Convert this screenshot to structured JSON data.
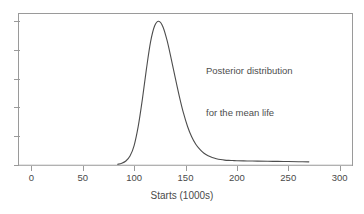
{
  "chart_data": {
    "type": "line",
    "title": "",
    "subtitle": "",
    "xlabel": "Starts (1000s)",
    "ylabel": "",
    "xlim": [
      -12,
      312
    ],
    "ylim": [
      0,
      1.05
    ],
    "grid": false,
    "legend_position": "none",
    "xticks": [
      0,
      50,
      100,
      150,
      200,
      250,
      300
    ],
    "xticklabels": [
      "0",
      "50",
      "100",
      "150",
      "200",
      "250",
      "300"
    ],
    "yticks": [
      0,
      0.2,
      0.4,
      0.6,
      0.8,
      1.0
    ],
    "yticklabels": [
      "",
      "",
      "",
      "",
      "",
      ""
    ],
    "annotations": [
      {
        "lines": [
          "Posterior distribution",
          "for the mean life"
        ],
        "x": 175,
        "y": 0.85
      }
    ],
    "series": [
      {
        "name": "Posterior density of mean life",
        "color": "#4d4d4d",
        "linewidth": 1.1,
        "x": [
          84,
          88,
          92,
          96,
          100,
          104,
          108,
          112,
          116,
          120,
          124,
          128,
          132,
          136,
          140,
          144,
          148,
          152,
          156,
          160,
          164,
          168,
          172,
          176,
          180,
          184,
          188,
          192,
          196,
          200,
          210,
          220,
          230,
          240,
          250,
          260,
          270
        ],
        "y": [
          0.005,
          0.012,
          0.028,
          0.062,
          0.135,
          0.268,
          0.455,
          0.668,
          0.856,
          0.968,
          1.0,
          0.962,
          0.868,
          0.742,
          0.608,
          0.478,
          0.362,
          0.268,
          0.196,
          0.144,
          0.108,
          0.082,
          0.064,
          0.052,
          0.044,
          0.038,
          0.034,
          0.032,
          0.031,
          0.03,
          0.028,
          0.027,
          0.026,
          0.025,
          0.024,
          0.023,
          0.022
        ]
      }
    ]
  },
  "axes": {
    "frame_color": "#9a9a9a",
    "tick_color": "#9a9a9a",
    "baseline_color": "#c8c8c8",
    "background": "#ffffff"
  }
}
